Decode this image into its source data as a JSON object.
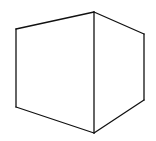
{
  "diagram": {
    "stroke_color": "#111111",
    "background_color": "#ffffff",
    "vertices": {
      "top_left": [
        16,
        29
      ],
      "top_center": [
        94,
        12
      ],
      "top_right": [
        144,
        34
      ],
      "bottom_right": [
        144,
        100
      ],
      "bottom_center": [
        94,
        133
      ],
      "bottom_left": [
        16,
        107
      ]
    },
    "faces": [
      {
        "name": "left-face",
        "points": "16,29 94,12 94,133 16,107"
      },
      {
        "name": "right-face",
        "points": "94,12 144,34 144,100 94,133"
      }
    ],
    "edges": [
      {
        "name": "top-left-edge",
        "x1": 16,
        "y1": 29,
        "x2": 94,
        "y2": 12
      },
      {
        "name": "top-right-edge",
        "x1": 94,
        "y1": 12,
        "x2": 144,
        "y2": 34
      },
      {
        "name": "right-vertical-edge",
        "x1": 144,
        "y1": 34,
        "x2": 144,
        "y2": 100
      },
      {
        "name": "bottom-right-edge",
        "x1": 144,
        "y1": 100,
        "x2": 94,
        "y2": 133
      },
      {
        "name": "bottom-left-edge",
        "x1": 94,
        "y1": 133,
        "x2": 16,
        "y2": 107
      },
      {
        "name": "left-vertical-edge",
        "x1": 16,
        "y1": 107,
        "x2": 16,
        "y2": 29
      },
      {
        "name": "center-vertical-edge",
        "x1": 94,
        "y1": 12,
        "x2": 94,
        "y2": 133
      }
    ]
  }
}
